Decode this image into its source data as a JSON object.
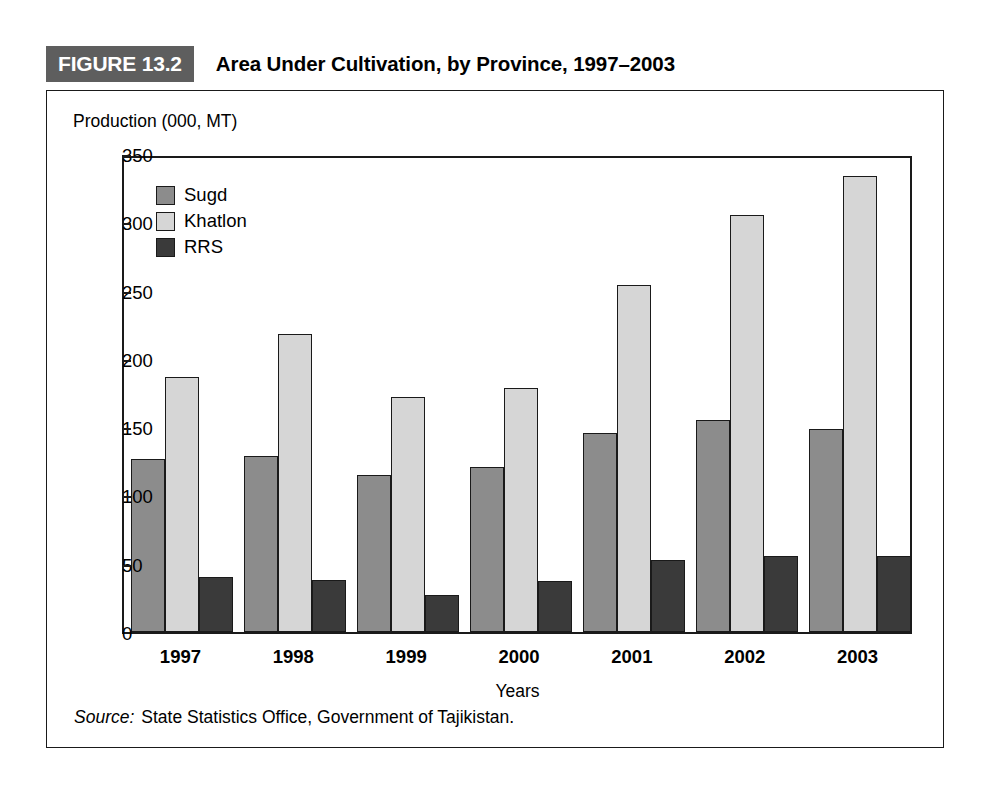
{
  "figure": {
    "badge": "FIGURE 13.2",
    "title": "Area Under Cultivation, by Province, 1997–2003",
    "source_keyword": "Source:",
    "source_text": "State Statistics Office, Government of Tajikistan."
  },
  "colors": {
    "badge_bg": "#5e5e5e",
    "sugd": "#8c8c8c",
    "khatlon": "#d6d6d6",
    "rrs": "#3a3a3a",
    "axis": "#1a1a1a"
  },
  "chart_data": {
    "type": "bar",
    "title": "Area Under Cultivation, by Province, 1997–2003",
    "xlabel": "Years",
    "ylabel": "Production (000, MT)",
    "categories": [
      "1997",
      "1998",
      "1999",
      "2000",
      "2001",
      "2002",
      "2003"
    ],
    "series": [
      {
        "name": "Sugd",
        "values": [
          127,
          129,
          115,
          121,
          146,
          155,
          149
        ]
      },
      {
        "name": "Khatlon",
        "values": [
          187,
          218,
          172,
          179,
          254,
          305,
          334
        ]
      },
      {
        "name": "RRS",
        "values": [
          40,
          38,
          27,
          37,
          53,
          56,
          56
        ]
      }
    ],
    "ylim": [
      0,
      350
    ],
    "yticks": [
      0,
      50,
      100,
      150,
      200,
      250,
      300,
      350
    ],
    "ytick_labels": [
      "0",
      "50",
      "100",
      "150",
      "200",
      "250",
      "300",
      "350"
    ],
    "grid": false,
    "legend_position": "top-left"
  }
}
